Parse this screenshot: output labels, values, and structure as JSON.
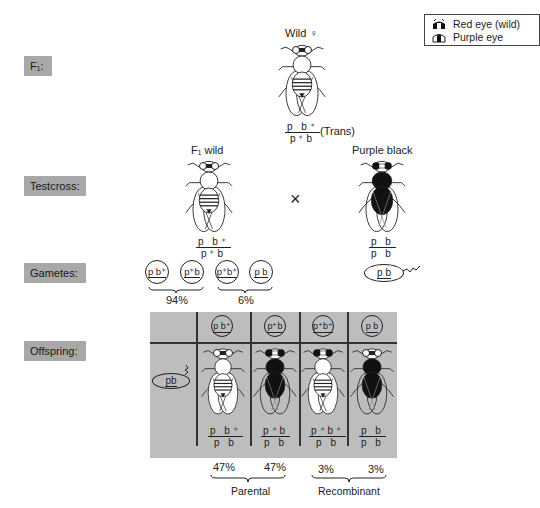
{
  "legend": {
    "items": [
      {
        "icon": "red-eye-icon",
        "label": "Red eye (wild)"
      },
      {
        "icon": "purple-eye-icon",
        "label": "Purple eye"
      }
    ]
  },
  "row_labels": {
    "f1": "F₁:",
    "testcross": "Testcross:",
    "gametes": "Gametes:",
    "offspring": "Offspring:"
  },
  "f1_parent": {
    "title": "Wild ♀",
    "genotype_top": "p  b⁺",
    "genotype_bottom": "p⁺b",
    "note": "(Trans)"
  },
  "testcross": {
    "left": {
      "title": "F₁ wild",
      "genotype_top": "p  b⁺",
      "genotype_bottom": "p⁺b"
    },
    "cross_symbol": "×",
    "right": {
      "title": "Purple black",
      "genotype_top": "p  b",
      "genotype_bottom": "p  b"
    }
  },
  "gametes": {
    "female": [
      {
        "label": "p b⁺"
      },
      {
        "label": "p⁺b"
      },
      {
        "label": "p⁺b⁺"
      },
      {
        "label": "p b"
      }
    ],
    "groups": [
      {
        "label": "94%"
      },
      {
        "label": "6%"
      }
    ],
    "male": {
      "label": "p b"
    }
  },
  "offspring": {
    "sperm_label": "pb",
    "columns": [
      {
        "egg": "p b⁺",
        "genotype_top": "p  b⁺",
        "genotype_bottom": "p  b",
        "percent": "47%",
        "eye": "red",
        "body": "wild"
      },
      {
        "egg": "p⁺b",
        "genotype_top": "p⁺b",
        "genotype_bottom": "p  b",
        "percent": "47%",
        "eye": "purple",
        "body": "black"
      },
      {
        "egg": "p⁺b⁺",
        "genotype_top": "p⁺b⁺",
        "genotype_bottom": "p  b",
        "percent": "3%",
        "eye": "purple",
        "body": "wild"
      },
      {
        "egg": "p b",
        "genotype_top": "p  b",
        "genotype_bottom": "p  b",
        "percent": "3%",
        "eye": "red",
        "body": "black"
      }
    ],
    "groups": [
      {
        "label": "Parental"
      },
      {
        "label": "Recombinant"
      }
    ]
  },
  "colors": {
    "label_box": "#a8a8a8",
    "table_bg": "#bdbdbd",
    "ink": "#222222"
  }
}
